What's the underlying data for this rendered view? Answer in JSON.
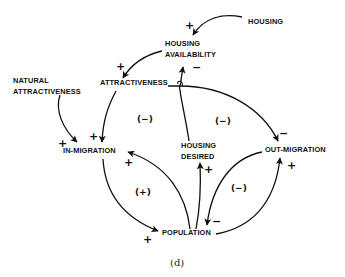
{
  "diagram": {
    "type": "causal-loop-diagram",
    "caption": "(d)",
    "nodes": {
      "housing": "HOUSING",
      "housing_availability_line1": "HOUSING",
      "housing_availability_line2": "AVAILABILITY",
      "attractiveness": "ATTRACTIVENESS",
      "natural_attractiveness_line1": "NATURAL",
      "natural_attractiveness_line2": "ATTRACTIVENESS",
      "in_migration": "IN-MIGRATION",
      "housing_desired_line1": "HOUSING",
      "housing_desired_line2": "DESIRED",
      "out_migration": "OUT-MIGRATION",
      "population": "POPULATION"
    },
    "edges": [
      {
        "from": "HOUSING",
        "to": "HOUSING AVAILABILITY",
        "sign": "+"
      },
      {
        "from": "HOUSING AVAILABILITY",
        "to": "ATTRACTIVENESS",
        "sign": "+"
      },
      {
        "from": "HOUSING DESIRED",
        "to": "HOUSING AVAILABILITY",
        "sign": "−"
      },
      {
        "from": "ATTRACTIVENESS",
        "to": "IN-MIGRATION",
        "sign": "+"
      },
      {
        "from": "NATURAL ATTRACTIVENESS",
        "to": "IN-MIGRATION",
        "sign": "+"
      },
      {
        "from": "ATTRACTIVENESS",
        "to": "OUT-MIGRATION",
        "sign": "−"
      },
      {
        "from": "POPULATION",
        "to": "IN-MIGRATION",
        "sign": "+"
      },
      {
        "from": "IN-MIGRATION",
        "to": "POPULATION",
        "sign": "+"
      },
      {
        "from": "POPULATION",
        "to": "HOUSING DESIRED",
        "sign": "+"
      },
      {
        "from": "OUT-MIGRATION",
        "to": "POPULATION",
        "sign": "−"
      },
      {
        "from": "POPULATION",
        "to": "OUT-MIGRATION",
        "sign": "+"
      }
    ],
    "signs": {
      "plus": "+",
      "minus": "−"
    },
    "loops": {
      "attractiveness_inmigration": "(−)",
      "attractiveness_outmigration": "(−)",
      "inmigration_population": "(+)",
      "outmigration_population": "(−)"
    }
  }
}
